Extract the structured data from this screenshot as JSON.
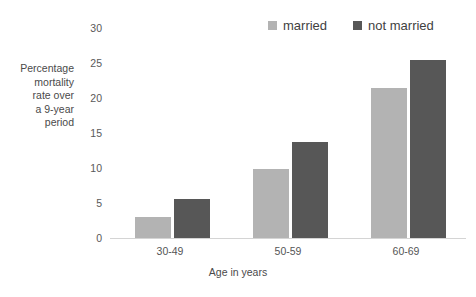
{
  "top_remnant": {
    "text": " "
  },
  "legend": {
    "position": "top-right",
    "items": [
      {
        "label": "married",
        "color": "#b3b3b3",
        "icon": "square-swatch-icon"
      },
      {
        "label": "not married",
        "color": "#575757",
        "icon": "square-swatch-icon"
      }
    ]
  },
  "axes": {
    "y_title_lines": [
      "Percentage",
      "mortality",
      "rate over",
      "a 9-year",
      "period"
    ],
    "y_ticks": [
      "0",
      "5",
      "10",
      "15",
      "20",
      "25",
      "30"
    ],
    "x_title": "Age in years",
    "x_ticks": [
      "30-49",
      "50-59",
      "60-69"
    ]
  },
  "chart_data": {
    "type": "bar",
    "title": "",
    "subtitle": "",
    "categories": [
      "30-49",
      "50-59",
      "60-69"
    ],
    "series": [
      {
        "name": "married",
        "color": "#b3b3b3",
        "values": [
          3.0,
          9.9,
          21.5
        ]
      },
      {
        "name": "not married",
        "color": "#575757",
        "values": [
          5.6,
          13.7,
          25.4
        ]
      }
    ],
    "xlabel": "Age in years",
    "ylabel": "Percentage mortality rate over a 9-year period",
    "ylim": [
      0,
      30
    ],
    "yticks": [
      0,
      5,
      10,
      15,
      20,
      25,
      30
    ],
    "grid": false,
    "legend": "top-right"
  }
}
